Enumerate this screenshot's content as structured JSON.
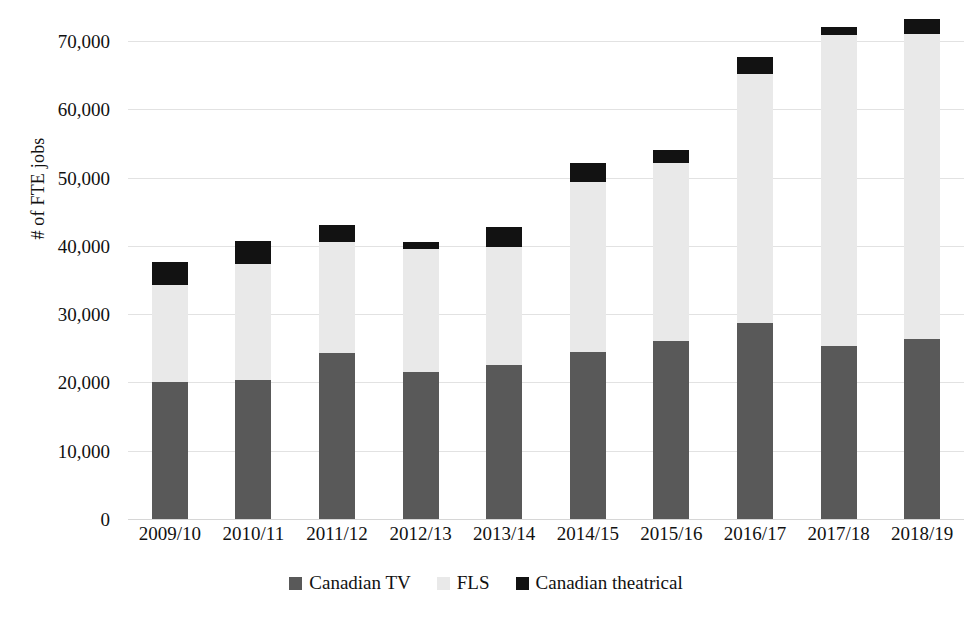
{
  "chart_data": {
    "type": "bar",
    "subtype": "stacked-bar",
    "title": "",
    "xlabel": "",
    "ylabel": "# of FTE jobs",
    "ylim": [
      0,
      70000
    ],
    "ytick_values": [
      0,
      10000,
      20000,
      30000,
      40000,
      50000,
      60000,
      70000
    ],
    "ytick_labels": [
      "0",
      "10,000",
      "20,000",
      "30,000",
      "40,000",
      "50,000",
      "60,000",
      "70,000"
    ],
    "grid": true,
    "legend_position": "bottom",
    "categories": [
      "2009/10",
      "2010/11",
      "2011/12",
      "2012/13",
      "2013/14",
      "2014/15",
      "2015/16",
      "2016/17",
      "2017/18",
      "2018/19"
    ],
    "series": [
      {
        "name": "Canadian TV",
        "color": "#595959",
        "values": [
          20000,
          20400,
          24300,
          21500,
          22600,
          24400,
          26000,
          28700,
          25400,
          26300
        ]
      },
      {
        "name": "FLS",
        "color": "#e9e9e9",
        "values": [
          14300,
          16900,
          16200,
          18100,
          17300,
          25000,
          26200,
          36400,
          45500,
          44800
        ]
      },
      {
        "name": "Canadian theatrical",
        "color": "#121212",
        "values": [
          3300,
          3400,
          2500,
          1000,
          2800,
          2800,
          1900,
          2500,
          1200,
          2100
        ]
      }
    ],
    "totals": [
      37600,
      40700,
      43000,
      40600,
      42700,
      52200,
      54100,
      67600,
      72100,
      73200
    ]
  },
  "legend": {
    "items": [
      {
        "label": "Canadian TV",
        "color": "#595959"
      },
      {
        "label": "FLS",
        "color": "#e9e9e9"
      },
      {
        "label": "Canadian theatrical",
        "color": "#121212"
      }
    ]
  },
  "axes": {
    "y_title": "# of FTE jobs"
  }
}
